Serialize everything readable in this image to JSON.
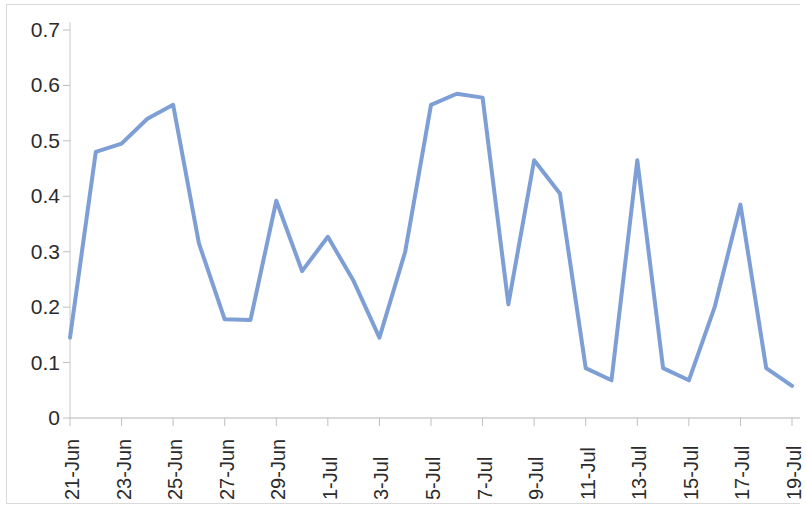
{
  "chart_data": {
    "type": "line",
    "title": "",
    "subtitle": "",
    "xlabel": "",
    "ylabel": "",
    "ylim": [
      0,
      0.7
    ],
    "ytick_labels": [
      "0.7",
      "0.6",
      "0.5",
      "0.4",
      "0.3",
      "0.2",
      "0.1",
      "0"
    ],
    "ytick_values": [
      0.7,
      0.6,
      0.5,
      0.4,
      0.3,
      0.2,
      0.1,
      0
    ],
    "grid": false,
    "legend": null,
    "legend_position": "none",
    "line_color": "#7e9fd5",
    "line_width": 4,
    "markers": false,
    "categories": [
      "21-Jun",
      "22-Jun",
      "23-Jun",
      "24-Jun",
      "25-Jun",
      "26-Jun",
      "27-Jun",
      "28-Jun",
      "29-Jun",
      "30-Jun",
      "1-Jul",
      "2-Jul",
      "3-Jul",
      "4-Jul",
      "5-Jul",
      "6-Jul",
      "7-Jul",
      "8-Jul",
      "9-Jul",
      "10-Jul",
      "11-Jul",
      "12-Jul",
      "13-Jul",
      "14-Jul",
      "15-Jul",
      "16-Jul",
      "17-Jul",
      "18-Jul",
      "19-Jul"
    ],
    "xtick_labels": [
      "21-Jun",
      "23-Jun",
      "25-Jun",
      "27-Jun",
      "29-Jun",
      "1-Jul",
      "3-Jul",
      "5-Jul",
      "7-Jul",
      "9-Jul",
      "11-Jul",
      "13-Jul",
      "15-Jul",
      "17-Jul",
      "19-Jul"
    ],
    "xtick_indices": [
      0,
      2,
      4,
      6,
      8,
      10,
      12,
      14,
      16,
      18,
      20,
      22,
      24,
      26,
      28
    ],
    "values": [
      0.145,
      0.48,
      0.495,
      0.54,
      0.565,
      0.315,
      0.178,
      0.177,
      0.392,
      0.265,
      0.327,
      0.247,
      0.145,
      0.3,
      0.565,
      0.585,
      0.578,
      0.205,
      0.465,
      0.405,
      0.09,
      0.068,
      0.465,
      0.09,
      0.068,
      0.2,
      0.385,
      0.09,
      0.058
    ]
  }
}
